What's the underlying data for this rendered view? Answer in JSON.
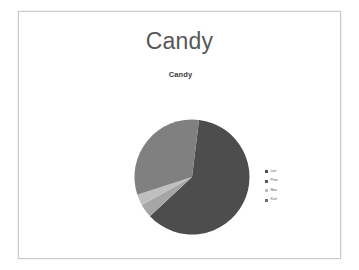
{
  "slide": {
    "title": "Candy",
    "background_color": "#ffffff",
    "border_color": "#c9c9c9"
  },
  "chart_data": {
    "type": "pie",
    "title": "Candy",
    "legend_position": "right",
    "categories": [
      "Lori",
      "Pete",
      "Max",
      "Kurt"
    ],
    "values": [
      93,
      2,
      4,
      1
    ],
    "colors": [
      "#4d4d4d",
      "#a6a6a6",
      "#bfbfbf",
      "#808080"
    ],
    "labels": [
      "",
      "",
      "",
      ""
    ],
    "slices": [
      {
        "name": "Lori",
        "value": 93,
        "color": "#4d4d4d",
        "start_angle": 7,
        "end_angle": 227,
        "label": ""
      },
      {
        "name": "Pete",
        "value": 2,
        "color": "#a6a6a6",
        "start_angle": 227,
        "end_angle": 241,
        "label": ""
      },
      {
        "name": "Max",
        "value": 4,
        "color": "#bfbfbf",
        "start_angle": 241,
        "end_angle": 252,
        "label": ""
      },
      {
        "name": "Kurt",
        "value": 1,
        "color": "#808080",
        "start_angle": 252,
        "end_angle": 367,
        "label": ""
      }
    ]
  },
  "legend": {
    "items": [
      {
        "label": "Lori",
        "color": "#4d4d4d"
      },
      {
        "label": "Pete",
        "color": "#595959"
      },
      {
        "label": "Max",
        "color": "#bfbfbf"
      },
      {
        "label": "Kurt",
        "color": "#6e6e6e"
      }
    ]
  }
}
